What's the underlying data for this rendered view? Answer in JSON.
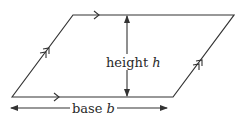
{
  "diagram": {
    "shape": "parallelogram",
    "stroke_color": "#333333",
    "labels": {
      "height": {
        "word": "height",
        "variable": "h"
      },
      "base": {
        "word": "base",
        "variable": "b"
      }
    },
    "markings": {
      "single_arrow_sides": [
        "top",
        "bottom"
      ],
      "double_arrow_sides": [
        "left",
        "right"
      ]
    },
    "vertices": {
      "bottom_left": [
        12,
        97
      ],
      "top_left": [
        73,
        15
      ],
      "top_right": [
        234,
        15
      ],
      "bottom_right": [
        173,
        97
      ]
    }
  }
}
